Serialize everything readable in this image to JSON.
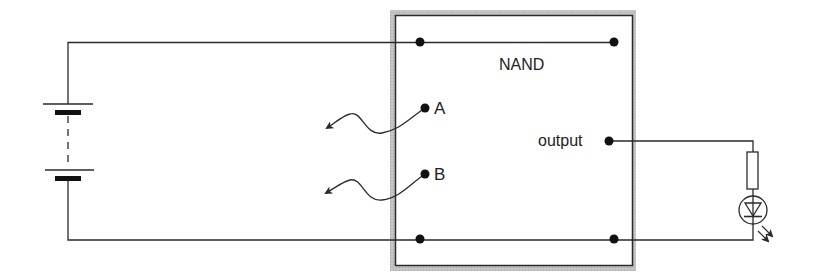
{
  "diagram": {
    "type": "circuit",
    "gate": {
      "label": "NAND",
      "inputs": [
        {
          "id": "A",
          "label": "A"
        },
        {
          "id": "B",
          "label": "B"
        }
      ],
      "output": {
        "label": "output"
      }
    },
    "components": [
      {
        "name": "battery",
        "symbol": "multi-cell battery (dashed)"
      },
      {
        "name": "NAND gate box",
        "symbol": "shaded rectangle"
      },
      {
        "name": "resistor",
        "symbol": "rectangle"
      },
      {
        "name": "LED",
        "symbol": "diode in circle with emission arrows"
      },
      {
        "name": "input A flying lead",
        "symbol": "wavy wire with arrow"
      },
      {
        "name": "input B flying lead",
        "symbol": "wavy wire with arrow"
      }
    ],
    "colors": {
      "line": "#2a2a2a",
      "frame_shade": "#b8b8b8",
      "background": "#ffffff"
    }
  }
}
